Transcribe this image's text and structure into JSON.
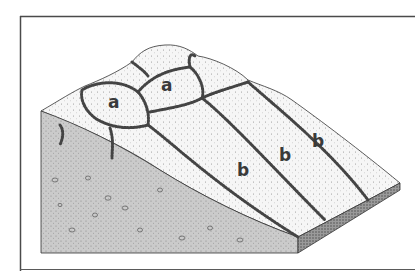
{
  "figure": {
    "labels": {
      "polygon_1": "a",
      "polygon_2": "a",
      "stripe_1": "b",
      "stripe_2": "b",
      "stripe_3": "b"
    },
    "colors": {
      "frame": "#4a4a4a",
      "front_face": "#c8c8c8",
      "surface": "#f4f4f4",
      "stones": "#555555",
      "label": "#3a3a3a"
    }
  }
}
